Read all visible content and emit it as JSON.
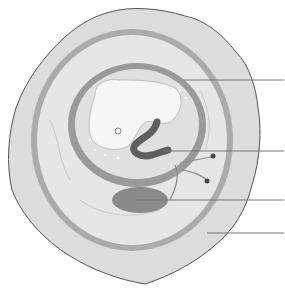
{
  "diagram": {
    "background": "#ffffff",
    "colors": {
      "chorion_outer": "#dcdcdc",
      "chorion_edge": "#555555",
      "chorion_band": "#a8a8a8",
      "exocoelom": "#e6e6e6",
      "amnion_band": "#9a9a9a",
      "amniotic_cavity": "#e0e0e0",
      "embryo": "#f6f6f6",
      "gut": "#5e5e5e",
      "yolk_sac": "#8a8a8a",
      "leader_line": "#777777"
    },
    "labels": [
      {
        "text": "",
        "y": 80,
        "x_start": 183,
        "x_end": 284
      },
      {
        "text": "",
        "y": 151,
        "x_start": 163,
        "x_end": 284
      },
      {
        "text": "",
        "y": 200,
        "x_start": 137,
        "x_end": 284
      },
      {
        "text": "",
        "y": 233,
        "x_start": 207,
        "x_end": 284
      }
    ]
  }
}
